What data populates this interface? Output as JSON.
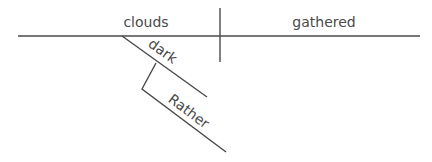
{
  "diagram": {
    "type": "sentence-diagram",
    "sentence": "Rather dark clouds gathered",
    "subject": "clouds",
    "predicate": "gathered",
    "modifiers": [
      {
        "word": "dark",
        "modifies": "clouds",
        "role": "adjective"
      },
      {
        "word": "Rather",
        "modifies": "dark",
        "role": "adverb"
      }
    ]
  },
  "colors": {
    "line": "#4a4a4a",
    "text": "#4a4a4a",
    "background": "#ffffff"
  }
}
